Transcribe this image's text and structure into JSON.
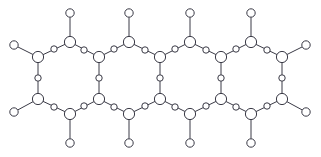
{
  "figure": {
    "title": "",
    "type": "molecular-structure-diagram",
    "background_color": "#ffffff",
    "stroke_color": "#3a3a46",
    "ring_atom_fill": "#ffffff",
    "substituent_fill": "#ffffff",
    "bond_node_fill": "#ffffff",
    "stroke_width": 1,
    "ring_atom_radius": 5.6,
    "bond_node_radius": 3.2,
    "substituent_radius": 4.2,
    "ring_count": 4,
    "width": 321,
    "height": 157
  },
  "chart_data": {
    "type": "scatter",
    "xlabel": "",
    "ylabel": "",
    "xlim": [
      0,
      321
    ],
    "ylim": [
      0,
      157
    ],
    "grid": false,
    "legend": "none",
    "ring_atoms": [
      {
        "id": "A1",
        "x": 38,
        "y": 57
      },
      {
        "id": "A2",
        "x": 70,
        "y": 42
      },
      {
        "id": "A3",
        "x": 99,
        "y": 57
      },
      {
        "id": "A4",
        "x": 129,
        "y": 42
      },
      {
        "id": "A5",
        "x": 160,
        "y": 57
      },
      {
        "id": "A6",
        "x": 190,
        "y": 42
      },
      {
        "id": "A7",
        "x": 221,
        "y": 57
      },
      {
        "id": "A8",
        "x": 251,
        "y": 42
      },
      {
        "id": "A9",
        "x": 282,
        "y": 57
      },
      {
        "id": "B1",
        "x": 38,
        "y": 99
      },
      {
        "id": "B2",
        "x": 70,
        "y": 114
      },
      {
        "id": "B3",
        "x": 99,
        "y": 99
      },
      {
        "id": "B4",
        "x": 129,
        "y": 114
      },
      {
        "id": "B5",
        "x": 160,
        "y": 99
      },
      {
        "id": "B6",
        "x": 190,
        "y": 114
      },
      {
        "id": "B7",
        "x": 221,
        "y": 99
      },
      {
        "id": "B8",
        "x": 251,
        "y": 114
      },
      {
        "id": "B9",
        "x": 282,
        "y": 99
      }
    ],
    "bond_nodes": [
      {
        "x": 54,
        "y": 49
      },
      {
        "x": 84,
        "y": 50
      },
      {
        "x": 114,
        "y": 49
      },
      {
        "x": 145,
        "y": 50
      },
      {
        "x": 175,
        "y": 49
      },
      {
        "x": 206,
        "y": 50
      },
      {
        "x": 236,
        "y": 49
      },
      {
        "x": 267,
        "y": 50
      },
      {
        "x": 54,
        "y": 107
      },
      {
        "x": 84,
        "y": 106
      },
      {
        "x": 114,
        "y": 107
      },
      {
        "x": 145,
        "y": 106
      },
      {
        "x": 175,
        "y": 107
      },
      {
        "x": 206,
        "y": 106
      },
      {
        "x": 236,
        "y": 107
      },
      {
        "x": 267,
        "y": 106
      },
      {
        "x": 99,
        "y": 78
      },
      {
        "x": 160,
        "y": 78
      },
      {
        "x": 221,
        "y": 78
      },
      {
        "x": 38,
        "y": 78
      },
      {
        "x": 282,
        "y": 78
      }
    ],
    "substituents": [
      {
        "id": "S-top-1",
        "x": 70,
        "y": 13,
        "attached_to": "A2"
      },
      {
        "id": "S-top-2",
        "x": 129,
        "y": 13,
        "attached_to": "A4"
      },
      {
        "id": "S-top-3",
        "x": 190,
        "y": 13,
        "attached_to": "A6"
      },
      {
        "id": "S-top-4",
        "x": 251,
        "y": 13,
        "attached_to": "A8"
      },
      {
        "id": "S-left-top",
        "x": 14,
        "y": 45,
        "attached_to": "A1"
      },
      {
        "id": "S-right-top",
        "x": 306,
        "y": 45,
        "attached_to": "A9"
      },
      {
        "id": "S-left-bot",
        "x": 14,
        "y": 112,
        "attached_to": "B1"
      },
      {
        "id": "S-right-bot",
        "x": 306,
        "y": 112,
        "attached_to": "B9"
      },
      {
        "id": "S-bot-1",
        "x": 70,
        "y": 143,
        "attached_to": "B2"
      },
      {
        "id": "S-bot-2",
        "x": 129,
        "y": 143,
        "attached_to": "B4"
      },
      {
        "id": "S-bot-3",
        "x": 190,
        "y": 143,
        "attached_to": "B6"
      },
      {
        "id": "S-bot-4",
        "x": 251,
        "y": 143,
        "attached_to": "B8"
      }
    ],
    "bonds": [
      {
        "from": "A1",
        "to": "A2"
      },
      {
        "from": "A2",
        "to": "A3"
      },
      {
        "from": "A3",
        "to": "A4"
      },
      {
        "from": "A4",
        "to": "A5"
      },
      {
        "from": "A5",
        "to": "A6"
      },
      {
        "from": "A6",
        "to": "A7"
      },
      {
        "from": "A7",
        "to": "A8"
      },
      {
        "from": "A8",
        "to": "A9"
      },
      {
        "from": "B1",
        "to": "B2"
      },
      {
        "from": "B2",
        "to": "B3"
      },
      {
        "from": "B3",
        "to": "B4"
      },
      {
        "from": "B4",
        "to": "B5"
      },
      {
        "from": "B5",
        "to": "B6"
      },
      {
        "from": "B6",
        "to": "B7"
      },
      {
        "from": "B7",
        "to": "B8"
      },
      {
        "from": "B8",
        "to": "B9"
      },
      {
        "from": "A1",
        "to": "B1"
      },
      {
        "from": "A3",
        "to": "B3"
      },
      {
        "from": "A5",
        "to": "B5"
      },
      {
        "from": "A7",
        "to": "B7"
      },
      {
        "from": "A9",
        "to": "B9"
      }
    ]
  }
}
